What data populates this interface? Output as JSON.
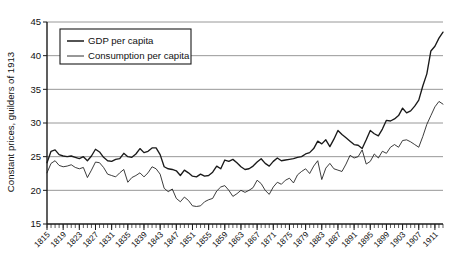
{
  "chart_data": {
    "type": "line",
    "title": "",
    "xlabel": "",
    "ylabel": "Constant prices, guilders of 1913",
    "ylim": [
      15,
      45
    ],
    "xlim": [
      1815,
      1913
    ],
    "yticks": [
      15,
      20,
      25,
      30,
      35,
      40,
      45
    ],
    "grid": "horizontal",
    "legend_position": "upper-left",
    "xtick_labels": [
      "1815",
      "1819",
      "1823",
      "1827",
      "1831",
      "1835",
      "1839",
      "1843",
      "1847",
      "1851",
      "1855",
      "1859",
      "1863",
      "1867",
      "1871",
      "1875",
      "1879",
      "1883",
      "1887",
      "1891",
      "1895",
      "1899",
      "1903",
      "1907",
      "1911"
    ],
    "xtick_step": 4,
    "minor_tick_step": 1,
    "x": [
      1815,
      1816,
      1817,
      1818,
      1819,
      1820,
      1821,
      1822,
      1823,
      1824,
      1825,
      1826,
      1827,
      1828,
      1829,
      1830,
      1831,
      1832,
      1833,
      1834,
      1835,
      1836,
      1837,
      1838,
      1839,
      1840,
      1841,
      1842,
      1843,
      1844,
      1845,
      1846,
      1847,
      1848,
      1849,
      1850,
      1851,
      1852,
      1853,
      1854,
      1855,
      1856,
      1857,
      1858,
      1859,
      1860,
      1861,
      1862,
      1863,
      1864,
      1865,
      1866,
      1867,
      1868,
      1869,
      1870,
      1871,
      1872,
      1873,
      1874,
      1875,
      1876,
      1877,
      1878,
      1879,
      1880,
      1881,
      1882,
      1883,
      1884,
      1885,
      1886,
      1887,
      1888,
      1889,
      1890,
      1891,
      1892,
      1893,
      1894,
      1895,
      1896,
      1897,
      1898,
      1899,
      1900,
      1901,
      1902,
      1903,
      1904,
      1905,
      1906,
      1907,
      1908,
      1909,
      1910,
      1911,
      1912,
      1913
    ],
    "series": [
      {
        "name": "GDP per capita",
        "color": "#1a1a1a",
        "values": [
          24.1,
          25.8,
          26.0,
          25.3,
          25.1,
          25.0,
          25.1,
          24.9,
          24.7,
          25.0,
          24.4,
          25.1,
          26.1,
          25.7,
          24.9,
          24.4,
          24.3,
          24.6,
          24.7,
          25.5,
          25.0,
          24.9,
          25.4,
          26.2,
          25.6,
          25.8,
          26.3,
          26.3,
          25.3,
          23.5,
          23.2,
          23.1,
          22.9,
          22.2,
          23.0,
          22.6,
          22.1,
          22.0,
          22.4,
          22.1,
          22.2,
          22.7,
          23.6,
          23.2,
          24.5,
          24.3,
          24.6,
          24.1,
          23.5,
          23.1,
          23.2,
          23.6,
          24.2,
          24.7,
          24.0,
          23.6,
          24.3,
          24.8,
          24.4,
          24.5,
          24.6,
          24.7,
          24.9,
          25.0,
          25.4,
          25.6,
          26.2,
          27.3,
          26.9,
          27.5,
          26.5,
          27.6,
          28.9,
          28.3,
          27.8,
          27.3,
          26.8,
          26.7,
          26.2,
          27.5,
          28.9,
          28.4,
          28.1,
          29.1,
          30.4,
          30.3,
          30.6,
          31.1,
          32.2,
          31.5,
          31.8,
          32.5,
          33.4,
          35.5,
          37.3,
          40.7,
          41.4,
          42.6,
          43.5
        ]
      },
      {
        "name": "Consumption per capita",
        "color": "#1a1a1a",
        "values": [
          22.6,
          24.0,
          24.4,
          23.7,
          23.5,
          23.6,
          23.8,
          23.4,
          23.2,
          23.4,
          21.9,
          23.0,
          24.2,
          24.1,
          23.4,
          22.4,
          22.2,
          22.0,
          22.6,
          23.1,
          21.2,
          21.9,
          22.2,
          22.6,
          22.0,
          22.6,
          23.5,
          23.2,
          22.4,
          20.3,
          19.8,
          20.2,
          18.8,
          18.3,
          19.0,
          18.5,
          17.7,
          17.6,
          17.7,
          18.3,
          18.6,
          18.8,
          19.9,
          20.5,
          20.7,
          20.0,
          19.1,
          19.5,
          20.0,
          19.7,
          20.0,
          20.4,
          21.5,
          21.0,
          20.0,
          19.4,
          20.5,
          21.2,
          20.9,
          21.5,
          21.8,
          21.1,
          22.3,
          22.8,
          23.2,
          22.5,
          23.6,
          24.4,
          21.6,
          23.3,
          24.0,
          23.2,
          23.0,
          22.8,
          23.9,
          25.2,
          24.8,
          25.0,
          26.0,
          23.9,
          24.3,
          25.4,
          24.8,
          25.8,
          25.5,
          26.4,
          26.8,
          26.4,
          27.4,
          27.5,
          27.2,
          26.8,
          26.4,
          28.0,
          29.8,
          31.1,
          32.4,
          33.2,
          32.8
        ]
      }
    ]
  },
  "legend": {
    "items": [
      {
        "label": "GDP per capita"
      },
      {
        "label": "Consumption per capita"
      }
    ]
  }
}
